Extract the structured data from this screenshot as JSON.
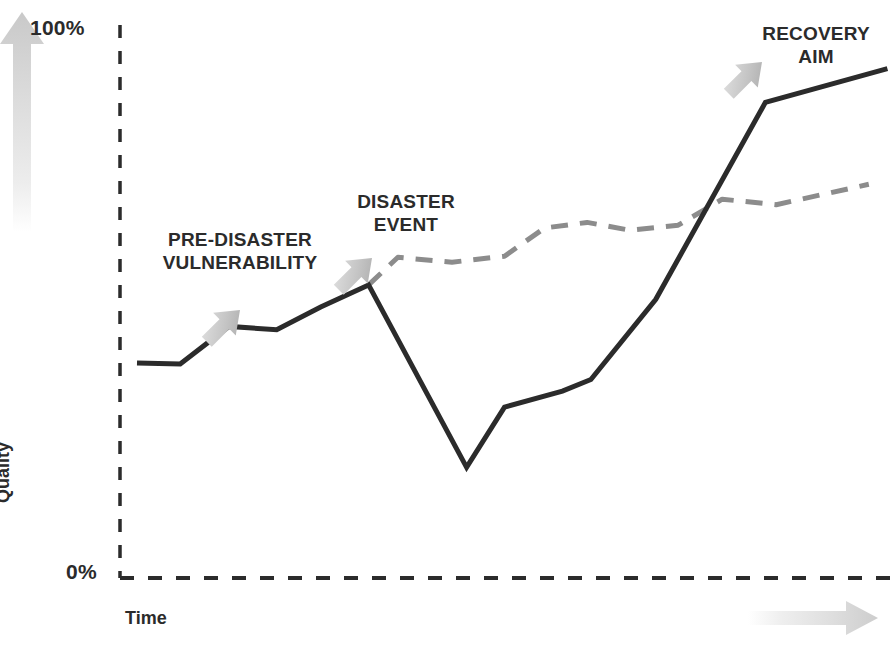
{
  "figure": {
    "background_color": "#ffffff",
    "line_color": "#2b2b2b",
    "dashed_series_color": "#8c8c8c",
    "arrow_color": "#c9c9c9",
    "axis_color": "#2b2b2b"
  },
  "axes": {
    "y_title": "Quality",
    "x_title": "Time",
    "y_max_label": "100%",
    "y_min_label": "0%",
    "y_axis_arrow_icon": "up-arrow-icon",
    "x_axis_arrow_icon": "right-arrow-icon"
  },
  "annotations": [
    {
      "id": "pre-disaster",
      "line1": "PRE-DISASTER",
      "line2": "VULNERABILITY",
      "text": "PRE-DISASTER VULNERABILITY",
      "arrow_icon": "down-left-arrow-icon",
      "arrow_target_x": 249,
      "arrow_target_y": 352
    },
    {
      "id": "disaster-event",
      "line1": "DISASTER",
      "line2": "EVENT",
      "text": "DISASTER EVENT",
      "arrow_icon": "down-left-arrow-icon",
      "arrow_target_x": 381,
      "arrow_target_y": 300
    },
    {
      "id": "recovery-aim",
      "line1": "RECOVERY",
      "line2": "AIM",
      "text": "RECOVERY AIM",
      "arrow_icon": "down-left-arrow-icon",
      "arrow_target_x": 770,
      "arrow_target_y": 104
    }
  ],
  "chart_data": {
    "type": "line",
    "title": "",
    "xlabel": "Time",
    "ylabel": "Quality",
    "xlim": [
      0,
      100
    ],
    "ylim": [
      0,
      100
    ],
    "grid": false,
    "legend": "none",
    "y_ticks": [
      0,
      100
    ],
    "y_tick_labels": [
      "0%",
      "100%"
    ],
    "x_ticks": [],
    "x_tick_labels": [],
    "series": [
      {
        "name": "Recovery aim (actual performance)",
        "style": "solid",
        "color": "#2b2b2b",
        "width": 5,
        "points": [
          {
            "x": 2.2,
            "y": 38.9
          },
          {
            "x": 7.8,
            "y": 38.7
          },
          {
            "x": 14.1,
            "y": 45.5
          },
          {
            "x": 20.3,
            "y": 44.9
          },
          {
            "x": 26.0,
            "y": 49.0
          },
          {
            "x": 32.2,
            "y": 53.0
          },
          {
            "x": 44.9,
            "y": 20.0
          },
          {
            "x": 49.8,
            "y": 30.9
          },
          {
            "x": 57.3,
            "y": 33.8
          },
          {
            "x": 61.0,
            "y": 35.9
          },
          {
            "x": 69.4,
            "y": 50.4
          },
          {
            "x": 83.6,
            "y": 86.0
          },
          {
            "x": 99.4,
            "y": 92.1
          }
        ]
      },
      {
        "name": "Pre-disaster vulnerability trend (projected)",
        "style": "dashed",
        "color": "#8c8c8c",
        "width": 5,
        "points": [
          {
            "x": 32.2,
            "y": 53.0
          },
          {
            "x": 36.0,
            "y": 58.0
          },
          {
            "x": 43.0,
            "y": 57.1
          },
          {
            "x": 49.8,
            "y": 58.2
          },
          {
            "x": 55.0,
            "y": 63.3
          },
          {
            "x": 60.5,
            "y": 64.3
          },
          {
            "x": 66.0,
            "y": 62.9
          },
          {
            "x": 72.3,
            "y": 63.8
          },
          {
            "x": 78.0,
            "y": 68.5
          },
          {
            "x": 85.0,
            "y": 67.5
          },
          {
            "x": 97.0,
            "y": 71.2
          }
        ]
      }
    ],
    "reference_lines": [
      {
        "name": "y-axis",
        "orientation": "vertical",
        "style": "dashed",
        "value": 0
      },
      {
        "name": "x-axis baseline",
        "orientation": "horizontal",
        "style": "dashed",
        "value": 0
      }
    ]
  }
}
